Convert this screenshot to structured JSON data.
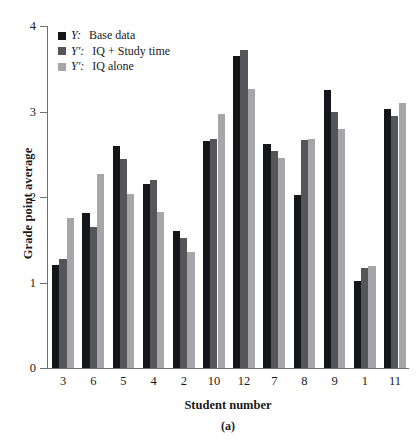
{
  "chart_data": {
    "type": "bar",
    "title": "",
    "subtitle": "",
    "xlabel": "Student number",
    "ylabel": "Grade point average",
    "caption": "(a)",
    "categories": [
      "3",
      "6",
      "5",
      "4",
      "2",
      "10",
      "12",
      "7",
      "8",
      "9",
      "1",
      "11"
    ],
    "yticks": [
      "0",
      "1",
      "2",
      "3",
      "4"
    ],
    "ylim": [
      0,
      4
    ],
    "grid": false,
    "legend_position": "top-left",
    "series": [
      {
        "name": "Y:  Base data",
        "symbol": "Y",
        "prime": "",
        "label": "Base data",
        "color": "#15161a",
        "values": [
          1.2,
          1.81,
          2.6,
          2.15,
          1.6,
          2.65,
          3.65,
          2.62,
          2.02,
          3.25,
          1.02,
          3.03
        ]
      },
      {
        "name": "Y′:  IQ + Study time",
        "symbol": "Y",
        "prime": "′",
        "label": "IQ + Study time",
        "color": "#56565a",
        "values": [
          1.27,
          1.65,
          2.45,
          2.2,
          1.52,
          2.68,
          3.72,
          2.54,
          2.67,
          3.0,
          1.17,
          2.95
        ]
      },
      {
        "name": "Y′:  IQ alone",
        "symbol": "Y",
        "prime": "′",
        "label": "IQ alone",
        "color": "#a6a6a8",
        "values": [
          1.75,
          2.27,
          2.04,
          1.83,
          1.36,
          2.97,
          3.26,
          2.46,
          2.68,
          2.8,
          1.19,
          3.1
        ]
      }
    ]
  }
}
